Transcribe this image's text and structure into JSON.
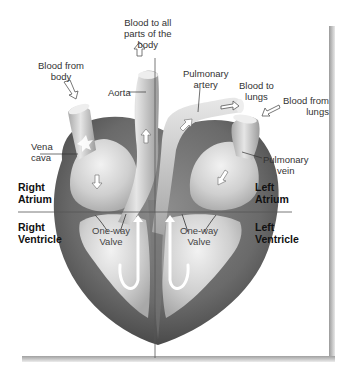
{
  "figure": {
    "labels": {
      "blood_to_all_parts": [
        "Blood to all",
        "parts of the",
        "body"
      ],
      "blood_from_body": [
        "Blood from",
        "body"
      ],
      "aorta": "Aorta",
      "pulmonary_artery": [
        "Pulmonary",
        "artery"
      ],
      "blood_to_lungs": [
        "Blood to",
        "lungs"
      ],
      "blood_from_lungs": [
        "Blood from",
        "lungs"
      ],
      "vena_cava": [
        "Vena",
        "cava"
      ],
      "pulmonary_vein": [
        "Pulmonary",
        "vein"
      ],
      "right_atrium": [
        "Right",
        "Atrium"
      ],
      "left_atrium": [
        "Left",
        "Atrium"
      ],
      "right_ventricle": [
        "Right",
        "Ventricle"
      ],
      "left_ventricle": [
        "Left",
        "Ventricle"
      ],
      "one_way_valve_right": [
        "One-way",
        "Valve"
      ],
      "one_way_valve_left": [
        "One-way",
        "Valve"
      ]
    },
    "colors": {
      "heart_outer": "#5a5a5a",
      "heart_mid": "#8a8a8a",
      "chamber_fill": "#d8d8d8",
      "vessel_fill": "#c8c8c8",
      "arrow_fill": "#ffffff",
      "divider_line": "#555555"
    }
  }
}
